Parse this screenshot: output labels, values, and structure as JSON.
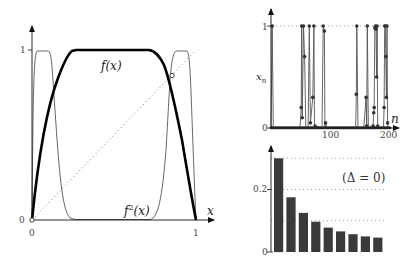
{
  "chart_data": [
    {
      "id": "map",
      "type": "line",
      "title": "",
      "xlabel": "x",
      "ylabel": "",
      "xlim": [
        0,
        1
      ],
      "ylim": [
        0,
        1
      ],
      "xticks": [
        "0",
        "1"
      ],
      "yticks": [
        "0",
        "1"
      ],
      "grid": false,
      "series": [
        {
          "name": "f(x)",
          "label": "f(x)",
          "style": "thick black",
          "description": "rises steeply from (0,0) to plateau at 1 over x≈0.23–0.77, then falls to (1,0)"
        },
        {
          "name": "f^2(x)",
          "label": "f²(x)",
          "style": "thin gray",
          "description": "second iterate: near 1 at x≈0.02–0.12 and x≈0.88–0.98, near 0 over x≈0.3–0.7"
        },
        {
          "name": "diagonal",
          "label": "",
          "style": "dotted",
          "description": "y = x"
        }
      ],
      "annotations": [
        {
          "type": "fixed-point",
          "x": 0,
          "y": 0,
          "marker": "open circle"
        },
        {
          "type": "fixed-point",
          "x": 0.85,
          "y": 0.85,
          "marker": "open circle"
        }
      ],
      "labels": {
        "f": "f(x)",
        "f2_base": "f",
        "f2_sup": "2",
        "f2_arg": "(x)"
      }
    },
    {
      "id": "timeseries",
      "type": "line",
      "title": "",
      "xlabel": "n",
      "ylabel": "x_n",
      "xlim": [
        0,
        210
      ],
      "ylim": [
        0,
        1
      ],
      "xticks": [
        "100",
        "200"
      ],
      "yticks": [
        "0",
        "1"
      ],
      "grid": "dotted at y=1",
      "description": "intermittent orbit: long laminar stretches near 0 interrupted by bursts to 1",
      "bursts_n": [
        2,
        53,
        58,
        66,
        75,
        90,
        93,
        148,
        166,
        178,
        180,
        183,
        197,
        200
      ],
      "x": [
        0,
        2,
        4,
        50,
        52,
        53,
        54,
        56,
        58,
        60,
        64,
        66,
        68,
        72,
        74,
        75,
        76,
        88,
        90,
        92,
        93,
        94,
        96,
        100,
        140,
        146,
        147,
        148,
        150,
        160,
        164,
        165,
        166,
        168,
        170,
        176,
        177,
        178,
        179,
        180,
        181,
        182,
        183,
        184,
        186,
        190,
        194,
        195,
        196,
        197,
        198,
        199,
        200,
        201,
        202
      ],
      "values": [
        0,
        1,
        0,
        0,
        0.2,
        1,
        0.1,
        1,
        0.7,
        0,
        0,
        1,
        0.05,
        0.3,
        1,
        0,
        0.02,
        0,
        1,
        0.95,
        0,
        0.05,
        0,
        0,
        0,
        0,
        0.33,
        1,
        0,
        0,
        0.3,
        0.02,
        1,
        0,
        0,
        0.02,
        0.15,
        0.2,
        0.98,
        1,
        0.97,
        0.5,
        1,
        0.02,
        0,
        0,
        0,
        0.2,
        1,
        1,
        0.7,
        0.3,
        1,
        0.05,
        0
      ]
    },
    {
      "id": "distribution",
      "type": "bar",
      "title": "",
      "xlabel": "",
      "ylabel": "",
      "ylim": [
        0,
        0.32
      ],
      "yticks": [
        "0",
        "0.2"
      ],
      "grid": "dotted at 0.1, 0.2, 0.3",
      "annotation": "(Δ = 0)",
      "categories": [
        "1",
        "2",
        "3",
        "4",
        "5",
        "6",
        "7",
        "8",
        "9"
      ],
      "values": [
        0.3,
        0.175,
        0.125,
        0.097,
        0.078,
        0.066,
        0.057,
        0.05,
        0.046
      ]
    }
  ],
  "labels": {
    "left_xtick_0": "0",
    "left_xtick_1": "1",
    "left_ytick_0": "0",
    "left_ytick_1": "1",
    "left_xlabel": "x",
    "f_label": "f(x)",
    "f2_label_base": "f",
    "f2_label_sup": "2",
    "f2_label_arg": "(x)",
    "ts_ytick_0": "0",
    "ts_ytick_1": "1",
    "ts_xtick_100": "100",
    "ts_xtick_200": "200",
    "ts_xlabel": "n",
    "ts_ylabel_base": "x",
    "ts_ylabel_sub": "n",
    "bar_ytick_0": "0",
    "bar_ytick_02": "0.2",
    "bar_annotation": "(Δ = 0)"
  }
}
